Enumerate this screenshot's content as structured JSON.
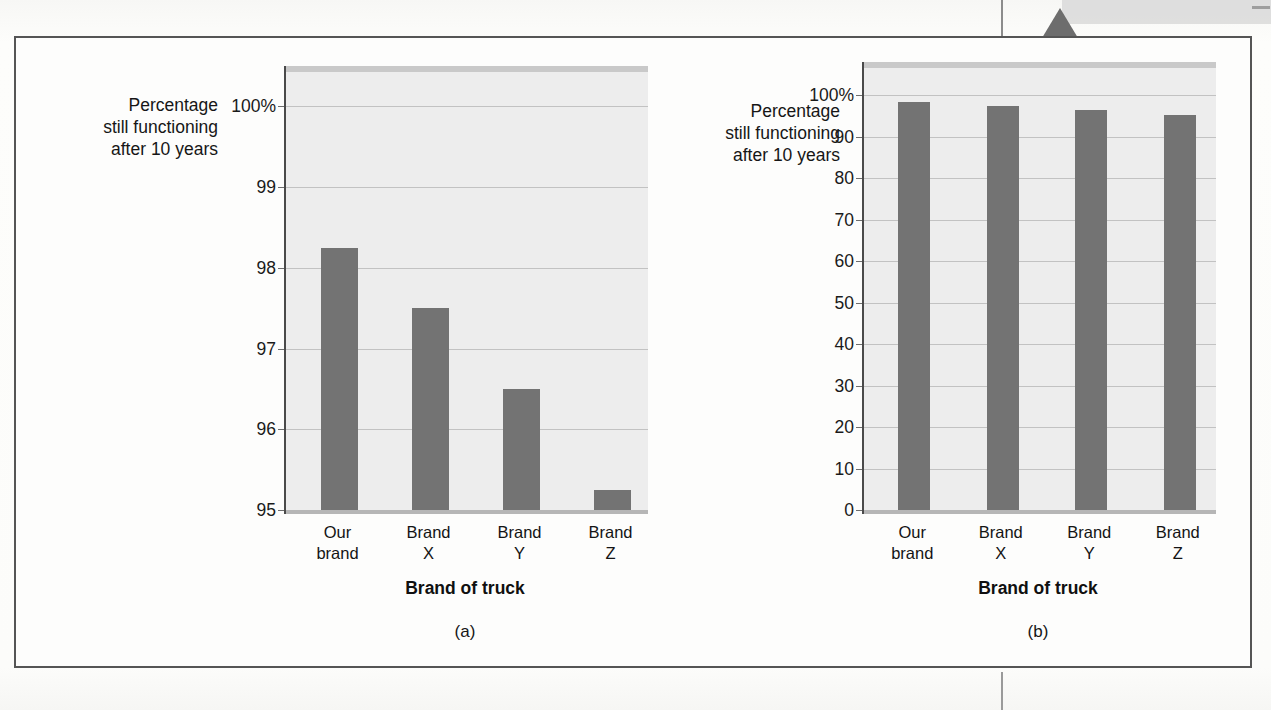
{
  "figure": {
    "panels": [
      {
        "caption": "(a)",
        "y_axis_title_lines": [
          "Percentage",
          "still functioning",
          "after 10 years"
        ],
        "x_axis_title": "Brand of truck"
      },
      {
        "caption": "(b)",
        "y_axis_title_lines": [
          "Percentage",
          "still functioning",
          "after 10 years"
        ],
        "x_axis_title": "Brand of truck"
      }
    ],
    "colors": {
      "bar": "#737373",
      "plot_background": "#ededed",
      "gridline": "#c2c2c2",
      "axis": "#4a4a4a",
      "frame": "#555555",
      "scan_band": "#d9d9d9",
      "scan_marker": "#6d6d6d"
    }
  },
  "chart_data": [
    {
      "type": "bar",
      "title": "",
      "panel": "(a)",
      "categories": [
        "Our brand",
        "Brand X",
        "Brand Y",
        "Brand Z"
      ],
      "category_label_lines": [
        [
          "Our",
          "brand"
        ],
        [
          "Brand",
          "X"
        ],
        [
          "Brand",
          "Y"
        ],
        [
          "Brand",
          "Z"
        ]
      ],
      "values": [
        98.25,
        97.5,
        96.5,
        95.25
      ],
      "xlabel": "Brand of truck",
      "ylabel": "Percentage still functioning after 10 years",
      "ylim": [
        95,
        100.5
      ],
      "yticks": [
        95,
        96,
        97,
        98,
        99,
        100
      ],
      "ytick_labels": [
        "95",
        "96",
        "97",
        "98",
        "99",
        "100%"
      ],
      "grid": true,
      "legend": "none",
      "note": "Truncated y-axis starting at 95 exaggerates the differences between brands."
    },
    {
      "type": "bar",
      "title": "",
      "panel": "(b)",
      "categories": [
        "Our brand",
        "Brand X",
        "Brand Y",
        "Brand Z"
      ],
      "category_label_lines": [
        [
          "Our",
          "brand"
        ],
        [
          "Brand",
          "X"
        ],
        [
          "Brand",
          "Y"
        ],
        [
          "Brand",
          "Z"
        ]
      ],
      "values": [
        98.25,
        97.5,
        96.5,
        95.25
      ],
      "xlabel": "Brand of truck",
      "ylabel": "Percentage still functioning after 10 years",
      "ylim": [
        0,
        108
      ],
      "yticks": [
        0,
        10,
        20,
        30,
        40,
        50,
        60,
        70,
        80,
        90,
        100
      ],
      "ytick_labels": [
        "0",
        "10",
        "20",
        "30",
        "40",
        "50",
        "60",
        "70",
        "80",
        "90",
        "100%"
      ],
      "grid": true,
      "legend": "none",
      "note": "Full y-axis from 0 shows the brands are nearly identical."
    }
  ]
}
